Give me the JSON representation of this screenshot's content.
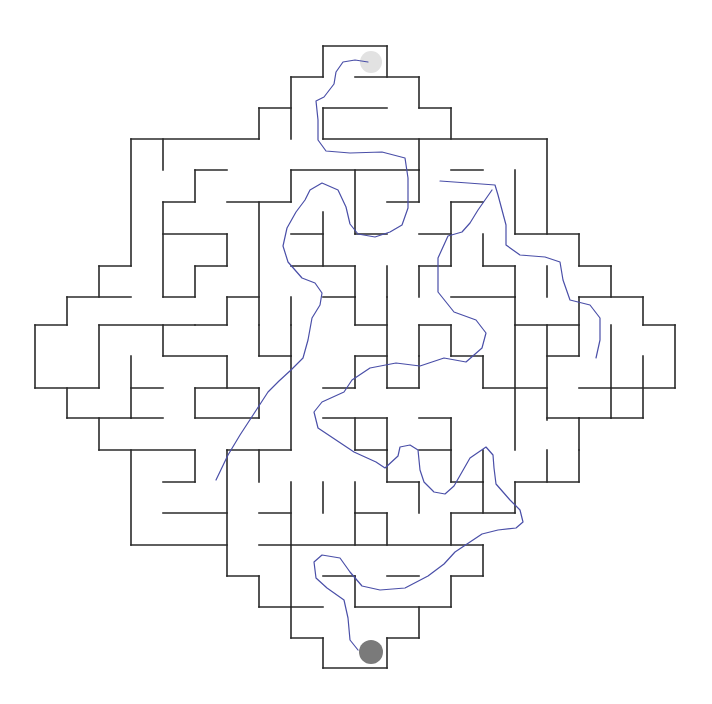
{
  "puzzle": {
    "type": "maze",
    "shape": "diamond",
    "colors": {
      "wall": "#2a2a2a",
      "solution_path": "#4a4fa8",
      "start_marker": "#e2e2e2",
      "end_marker": "#7a7a7a",
      "background": "#ffffff"
    },
    "start": {
      "cx": 371,
      "cy": 62,
      "r": 11
    },
    "end": {
      "cx": 371,
      "cy": 652,
      "r": 12
    },
    "walls": [
      [
        323,
        46,
        387,
        46
      ],
      [
        323,
        46,
        323,
        77
      ],
      [
        387,
        46,
        387,
        77
      ],
      [
        291,
        77,
        323,
        77
      ],
      [
        355,
        77,
        419,
        77
      ],
      [
        291,
        77,
        291,
        139
      ],
      [
        419,
        77,
        419,
        108
      ],
      [
        259,
        108,
        291,
        108
      ],
      [
        323,
        108,
        387,
        108
      ],
      [
        419,
        108,
        451,
        108
      ],
      [
        259,
        108,
        259,
        139
      ],
      [
        323,
        108,
        323,
        139
      ],
      [
        451,
        108,
        451,
        139
      ],
      [
        131,
        139,
        259,
        139
      ],
      [
        323,
        139,
        547,
        139
      ],
      [
        163,
        139,
        163,
        170
      ],
      [
        131,
        139,
        131,
        266
      ],
      [
        419,
        139,
        419,
        170
      ],
      [
        547,
        139,
        547,
        234
      ],
      [
        195,
        170,
        227,
        170
      ],
      [
        291,
        170,
        419,
        170
      ],
      [
        195,
        170,
        195,
        202
      ],
      [
        291,
        170,
        291,
        202
      ],
      [
        355,
        170,
        355,
        234
      ],
      [
        419,
        170,
        419,
        202
      ],
      [
        451,
        170,
        483,
        170
      ],
      [
        515,
        170,
        515,
        234
      ],
      [
        163,
        202,
        195,
        202
      ],
      [
        227,
        202,
        291,
        202
      ],
      [
        387,
        202,
        419,
        202
      ],
      [
        451,
        202,
        483,
        202
      ],
      [
        451,
        202,
        451,
        266
      ],
      [
        163,
        202,
        163,
        297
      ],
      [
        259,
        202,
        259,
        325
      ],
      [
        163,
        234,
        227,
        234
      ],
      [
        227,
        234,
        227,
        266
      ],
      [
        291,
        234,
        323,
        234
      ],
      [
        323,
        212,
        323,
        266
      ],
      [
        355,
        234,
        387,
        234
      ],
      [
        419,
        234,
        451,
        234
      ],
      [
        483,
        234,
        483,
        266
      ],
      [
        515,
        234,
        579,
        234
      ],
      [
        579,
        234,
        579,
        266
      ],
      [
        99,
        266,
        131,
        266
      ],
      [
        99,
        266,
        99,
        297
      ],
      [
        195,
        266,
        227,
        266
      ],
      [
        195,
        266,
        195,
        297
      ],
      [
        291,
        266,
        355,
        266
      ],
      [
        355,
        266,
        355,
        297
      ],
      [
        387,
        266,
        387,
        297
      ],
      [
        419,
        266,
        451,
        266
      ],
      [
        419,
        266,
        419,
        297
      ],
      [
        483,
        266,
        515,
        266
      ],
      [
        515,
        266,
        515,
        297
      ],
      [
        547,
        266,
        547,
        297
      ],
      [
        579,
        266,
        611,
        266
      ],
      [
        611,
        266,
        611,
        297
      ],
      [
        67,
        297,
        131,
        297
      ],
      [
        67,
        297,
        67,
        325
      ],
      [
        163,
        297,
        195,
        297
      ],
      [
        227,
        297,
        259,
        297
      ],
      [
        227,
        297,
        227,
        325
      ],
      [
        291,
        297,
        291,
        325
      ],
      [
        323,
        297,
        355,
        297
      ],
      [
        355,
        297,
        355,
        325
      ],
      [
        387,
        297,
        387,
        388
      ],
      [
        451,
        297,
        515,
        297
      ],
      [
        515,
        297,
        515,
        325
      ],
      [
        579,
        297,
        643,
        297
      ],
      [
        643,
        297,
        643,
        325
      ],
      [
        579,
        297,
        579,
        356
      ],
      [
        35,
        325,
        67,
        325
      ],
      [
        35,
        325,
        35,
        388
      ],
      [
        99,
        325,
        195,
        325
      ],
      [
        99,
        325,
        99,
        388
      ],
      [
        163,
        325,
        163,
        356
      ],
      [
        195,
        325,
        227,
        325
      ],
      [
        259,
        325,
        259,
        356
      ],
      [
        291,
        325,
        291,
        356
      ],
      [
        355,
        325,
        387,
        325
      ],
      [
        419,
        325,
        451,
        325
      ],
      [
        419,
        325,
        419,
        356
      ],
      [
        451,
        325,
        451,
        356
      ],
      [
        515,
        325,
        579,
        325
      ],
      [
        515,
        325,
        515,
        450
      ],
      [
        547,
        325,
        547,
        420
      ],
      [
        611,
        325,
        611,
        388
      ],
      [
        643,
        325,
        675,
        325
      ],
      [
        675,
        325,
        675,
        388
      ],
      [
        163,
        356,
        227,
        356
      ],
      [
        227,
        356,
        227,
        388
      ],
      [
        131,
        356,
        131,
        418
      ],
      [
        259,
        356,
        291,
        356
      ],
      [
        291,
        356,
        291,
        450
      ],
      [
        355,
        356,
        387,
        356
      ],
      [
        355,
        356,
        355,
        388
      ],
      [
        419,
        356,
        419,
        388
      ],
      [
        451,
        356,
        483,
        356
      ],
      [
        483,
        356,
        483,
        388
      ],
      [
        547,
        356,
        579,
        356
      ],
      [
        579,
        388,
        675,
        388
      ],
      [
        35,
        388,
        99,
        388
      ],
      [
        67,
        388,
        67,
        418
      ],
      [
        131,
        388,
        163,
        388
      ],
      [
        195,
        388,
        259,
        388
      ],
      [
        195,
        388,
        195,
        418
      ],
      [
        259,
        388,
        259,
        418
      ],
      [
        323,
        388,
        355,
        388
      ],
      [
        387,
        388,
        419,
        388
      ],
      [
        483,
        388,
        547,
        388
      ],
      [
        611,
        388,
        611,
        418
      ],
      [
        643,
        356,
        643,
        418
      ],
      [
        67,
        418,
        131,
        418
      ],
      [
        99,
        418,
        99,
        450
      ],
      [
        131,
        418,
        163,
        418
      ],
      [
        195,
        418,
        259,
        418
      ],
      [
        323,
        418,
        387,
        418
      ],
      [
        355,
        418,
        355,
        450
      ],
      [
        387,
        418,
        387,
        450
      ],
      [
        419,
        418,
        451,
        418
      ],
      [
        451,
        418,
        451,
        450
      ],
      [
        547,
        418,
        579,
        418
      ],
      [
        579,
        418,
        611,
        418
      ],
      [
        611,
        418,
        643,
        418
      ],
      [
        579,
        418,
        579,
        450
      ],
      [
        99,
        450,
        195,
        450
      ],
      [
        195,
        450,
        195,
        482
      ],
      [
        227,
        450,
        291,
        450
      ],
      [
        355,
        450,
        387,
        450
      ],
      [
        387,
        450,
        387,
        482
      ],
      [
        419,
        450,
        451,
        450
      ],
      [
        451,
        450,
        451,
        482
      ],
      [
        483,
        450,
        483,
        482
      ],
      [
        515,
        482,
        579,
        482
      ],
      [
        579,
        450,
        579,
        482
      ],
      [
        547,
        450,
        547,
        482
      ],
      [
        131,
        450,
        131,
        545
      ],
      [
        163,
        482,
        195,
        482
      ],
      [
        227,
        450,
        227,
        576
      ],
      [
        259,
        450,
        259,
        482
      ],
      [
        291,
        482,
        291,
        545
      ],
      [
        323,
        482,
        323,
        513
      ],
      [
        355,
        482,
        355,
        513
      ],
      [
        387,
        482,
        419,
        482
      ],
      [
        419,
        482,
        419,
        513
      ],
      [
        451,
        482,
        483,
        482
      ],
      [
        483,
        482,
        483,
        513
      ],
      [
        515,
        482,
        515,
        513
      ],
      [
        163,
        513,
        227,
        513
      ],
      [
        259,
        513,
        291,
        513
      ],
      [
        355,
        513,
        387,
        513
      ],
      [
        387,
        513,
        387,
        545
      ],
      [
        451,
        513,
        515,
        513
      ],
      [
        451,
        513,
        451,
        545
      ],
      [
        131,
        545,
        227,
        545
      ],
      [
        259,
        545,
        483,
        545
      ],
      [
        355,
        513,
        355,
        545
      ],
      [
        483,
        545,
        483,
        576
      ],
      [
        227,
        576,
        259,
        576
      ],
      [
        259,
        576,
        259,
        607
      ],
      [
        291,
        545,
        291,
        607
      ],
      [
        323,
        576,
        355,
        576
      ],
      [
        355,
        576,
        355,
        607
      ],
      [
        387,
        576,
        419,
        576
      ],
      [
        451,
        576,
        483,
        576
      ],
      [
        451,
        576,
        451,
        607
      ],
      [
        259,
        607,
        323,
        607
      ],
      [
        291,
        607,
        291,
        638
      ],
      [
        355,
        607,
        451,
        607
      ],
      [
        419,
        607,
        419,
        638
      ],
      [
        291,
        638,
        323,
        638
      ],
      [
        323,
        638,
        323,
        668
      ],
      [
        387,
        638,
        419,
        638
      ],
      [
        387,
        638,
        387,
        668
      ],
      [
        323,
        668,
        387,
        668
      ]
    ],
    "solution_path": [
      [
        368,
        62
      ],
      [
        355,
        60
      ],
      [
        343,
        62
      ],
      [
        336,
        72
      ],
      [
        334,
        84
      ],
      [
        324,
        97
      ],
      [
        316,
        101
      ],
      [
        318,
        120
      ],
      [
        318,
        140
      ],
      [
        326,
        151
      ],
      [
        350,
        153
      ],
      [
        382,
        152
      ],
      [
        405,
        158
      ],
      [
        408,
        178
      ],
      [
        408,
        208
      ],
      [
        402,
        225
      ],
      [
        390,
        232
      ],
      [
        375,
        237
      ],
      [
        358,
        234
      ],
      [
        350,
        224
      ],
      [
        346,
        207
      ],
      [
        338,
        190
      ],
      [
        322,
        183
      ],
      [
        310,
        190
      ],
      [
        305,
        200
      ],
      [
        296,
        212
      ],
      [
        287,
        228
      ],
      [
        283,
        246
      ],
      [
        288,
        262
      ],
      [
        302,
        278
      ],
      [
        315,
        283
      ],
      [
        322,
        293
      ],
      [
        320,
        305
      ],
      [
        312,
        318
      ],
      [
        308,
        340
      ],
      [
        303,
        358
      ],
      [
        291,
        370
      ],
      [
        279,
        381
      ],
      [
        268,
        392
      ],
      [
        255,
        412
      ],
      [
        240,
        435
      ],
      [
        228,
        455
      ],
      [
        216,
        480
      ]
    ],
    "solution_path_2": [
      [
        440,
        181
      ],
      [
        468,
        183
      ],
      [
        495,
        185
      ],
      [
        498,
        195
      ],
      [
        506,
        225
      ],
      [
        506,
        245
      ],
      [
        520,
        255
      ],
      [
        545,
        257
      ],
      [
        560,
        262
      ],
      [
        563,
        280
      ],
      [
        570,
        300
      ],
      [
        590,
        305
      ],
      [
        600,
        318
      ],
      [
        600,
        340
      ],
      [
        596,
        358
      ]
    ],
    "solution_path_3": [
      [
        492,
        190
      ],
      [
        478,
        210
      ],
      [
        470,
        223
      ],
      [
        462,
        232
      ],
      [
        448,
        236
      ],
      [
        438,
        258
      ],
      [
        438,
        292
      ],
      [
        454,
        312
      ],
      [
        476,
        320
      ],
      [
        486,
        333
      ],
      [
        482,
        348
      ],
      [
        466,
        362
      ],
      [
        444,
        358
      ],
      [
        420,
        366
      ],
      [
        396,
        363
      ],
      [
        370,
        368
      ],
      [
        352,
        380
      ],
      [
        344,
        392
      ],
      [
        322,
        402
      ],
      [
        314,
        412
      ],
      [
        318,
        428
      ],
      [
        336,
        440
      ],
      [
        354,
        452
      ],
      [
        376,
        462
      ],
      [
        385,
        468
      ],
      [
        398,
        456
      ],
      [
        400,
        447
      ],
      [
        410,
        445
      ],
      [
        418,
        450
      ],
      [
        420,
        470
      ],
      [
        424,
        482
      ],
      [
        434,
        492
      ],
      [
        445,
        494
      ],
      [
        454,
        486
      ],
      [
        462,
        472
      ],
      [
        470,
        458
      ],
      [
        486,
        447
      ],
      [
        493,
        455
      ],
      [
        494,
        468
      ],
      [
        496,
        484
      ],
      [
        510,
        500
      ],
      [
        520,
        510
      ],
      [
        523,
        522
      ],
      [
        516,
        528
      ],
      [
        498,
        530
      ],
      [
        482,
        534
      ],
      [
        470,
        542
      ],
      [
        455,
        552
      ],
      [
        444,
        564
      ],
      [
        428,
        576
      ],
      [
        405,
        588
      ],
      [
        380,
        590
      ],
      [
        362,
        586
      ],
      [
        350,
        572
      ],
      [
        340,
        558
      ],
      [
        322,
        555
      ],
      [
        314,
        562
      ],
      [
        316,
        578
      ],
      [
        327,
        588
      ],
      [
        344,
        600
      ],
      [
        348,
        618
      ],
      [
        350,
        640
      ],
      [
        358,
        650
      ]
    ]
  }
}
